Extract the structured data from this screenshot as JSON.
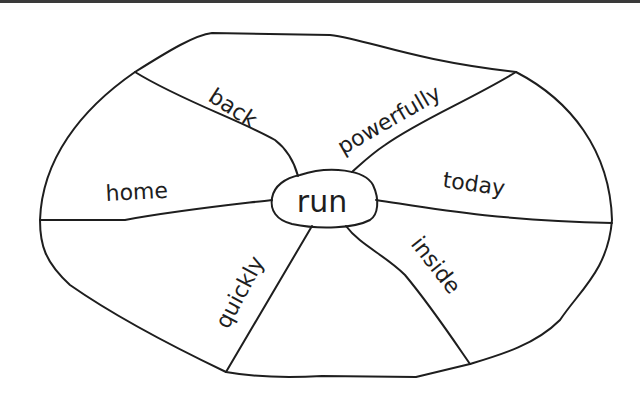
{
  "diagram": {
    "type": "word-web",
    "center_word": "run",
    "spokes": [
      {
        "label": "back",
        "position": "top-left"
      },
      {
        "label": "powerfully",
        "position": "top-right"
      },
      {
        "label": "home",
        "position": "left"
      },
      {
        "label": "today",
        "position": "right"
      },
      {
        "label": "quickly",
        "position": "bottom-left"
      },
      {
        "label": "inside",
        "position": "bottom-right"
      }
    ]
  },
  "colors": {
    "line": "#1e1e1e",
    "background": "#ffffff",
    "top_rule": "#3a3a3a"
  }
}
